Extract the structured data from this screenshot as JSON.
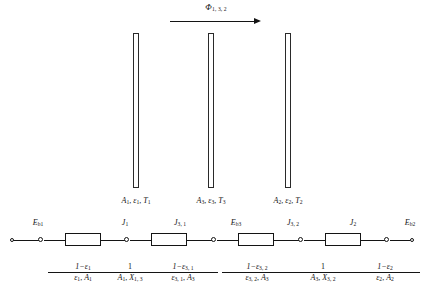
{
  "figure": {
    "type": "radiation-network-diagram",
    "flux": {
      "symbol": "Φ",
      "subscript": "1, 3, 2",
      "arrow_direction": "right"
    },
    "plates": [
      {
        "id": "plate-1",
        "area": "A",
        "area_sub": "1",
        "emissivity": "ε",
        "emissivity_sub": "1",
        "temperature": "T",
        "temperature_sub": "1"
      },
      {
        "id": "plate-3",
        "area": "A",
        "area_sub": "3",
        "emissivity": "ε",
        "emissivity_sub": "3",
        "temperature": "T",
        "temperature_sub": "3"
      },
      {
        "id": "plate-2",
        "area": "A",
        "area_sub": "2",
        "emissivity": "ε",
        "emissivity_sub": "2",
        "temperature": "T",
        "temperature_sub": "2"
      }
    ],
    "plate_captions": [
      "A₁, ε₁, T₁",
      "A₃, ε₃, T₃",
      "A₂, ε₂, T₂"
    ],
    "network": {
      "nodes": [
        {
          "name": "node-eb1",
          "symbol": "E",
          "subscript": "b1"
        },
        {
          "name": "node-j1",
          "symbol": "J",
          "subscript": "1"
        },
        {
          "name": "node-j31",
          "symbol": "J",
          "subscript": "3, 1"
        },
        {
          "name": "node-eb3",
          "symbol": "E",
          "subscript": "b3"
        },
        {
          "name": "node-j32",
          "symbol": "J",
          "subscript": "3, 2"
        },
        {
          "name": "node-j2",
          "symbol": "J",
          "subscript": "2"
        },
        {
          "name": "node-eb2",
          "symbol": "E",
          "subscript": "b2"
        }
      ],
      "node_labels": [
        "Eʙ₁",
        "J₁",
        "J₃,₁",
        "Eʙ₃",
        "J₃,₂",
        "J₂",
        "Eʙ₂"
      ],
      "resistors": [
        {
          "name": "resistor-surface-1",
          "numerator": "1−ε",
          "numerator_sub": "1",
          "denominator": "ε",
          "denominator_sub": "1",
          "denominator_tail": "A",
          "denominator_tail_sub": "1"
        },
        {
          "name": "resistor-space-1-3",
          "numerator": "1",
          "numerator_sub": "",
          "denominator": "A",
          "denominator_sub": "1",
          "denominator_tail": "X",
          "denominator_tail_sub": "1, 3"
        },
        {
          "name": "resistor-surface-3-1",
          "numerator": "1−ε",
          "numerator_sub": "3, 1",
          "denominator": "ε",
          "denominator_sub": "3, 1",
          "denominator_tail": "A",
          "denominator_tail_sub": "3"
        },
        {
          "name": "resistor-surface-3-2",
          "numerator": "1−ε",
          "numerator_sub": "3, 2",
          "denominator": "ε",
          "denominator_sub": "3, 2",
          "denominator_tail": "A",
          "denominator_tail_sub": "3"
        },
        {
          "name": "resistor-space-3-2",
          "numerator": "1",
          "numerator_sub": "",
          "denominator": "A",
          "denominator_sub": "3",
          "denominator_tail": "X",
          "denominator_tail_sub": "3, 2"
        },
        {
          "name": "resistor-surface-2",
          "numerator": "1−ε",
          "numerator_sub": "2",
          "denominator": "ε",
          "denominator_sub": "2",
          "denominator_tail": "A",
          "denominator_tail_sub": "2"
        }
      ]
    },
    "colors": {
      "ink": "#141414",
      "background": "#ffffff",
      "plate_outline": "#2a2a2a"
    }
  }
}
